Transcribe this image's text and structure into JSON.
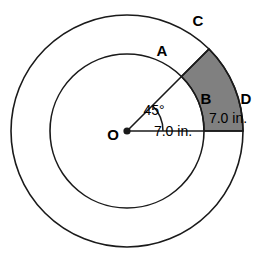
{
  "figure": {
    "background_color": "#ffffff",
    "stroke_color": "#1a1a1a",
    "shaded_fill_color": "#808080",
    "center": {
      "x": 127,
      "y": 131,
      "label": "O"
    },
    "circles": {
      "outer_radius_px": 116,
      "inner_radius_px": 77
    },
    "sector": {
      "start_angle_deg": 0,
      "end_angle_deg": 45,
      "shaded": true
    },
    "points": [
      {
        "id": "A",
        "label": "A",
        "x": 162,
        "y": 50
      },
      {
        "id": "B",
        "label": "B",
        "x": 206,
        "y": 98
      },
      {
        "id": "C",
        "label": "C",
        "x": 198,
        "y": 20
      },
      {
        "id": "D",
        "label": "D",
        "x": 246,
        "y": 98
      },
      {
        "id": "O",
        "label": "O",
        "x": 113,
        "y": 134
      }
    ],
    "measurements": [
      {
        "id": "angle",
        "label": "45°",
        "x": 154,
        "y": 110
      },
      {
        "id": "inner-radius",
        "label": "7.0 in.",
        "x": 173,
        "y": 131
      },
      {
        "id": "annulus-width",
        "label": "7.0 in.",
        "x": 228,
        "y": 118
      }
    ]
  }
}
